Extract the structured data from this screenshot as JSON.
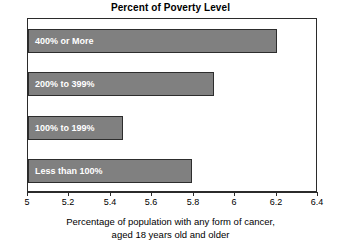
{
  "chart_data": {
    "type": "bar",
    "orientation": "horizontal",
    "title": "Percent of Poverty Level",
    "xlabel_line1": "Percentage of population with any form of cancer,",
    "xlabel_line2": "aged 18 years old and older",
    "ylabel": "",
    "categories": [
      "400% or More",
      "200% to 399%",
      "100% to 199%",
      "Less than 100%"
    ],
    "values": [
      6.2,
      5.9,
      5.46,
      5.79
    ],
    "xlim": [
      5,
      6.4
    ],
    "xticks": [
      5,
      5.2,
      5.4,
      5.6,
      5.8,
      6,
      6.4
    ],
    "xtick_labels": [
      "5",
      "5.2",
      "5.4",
      "5.6",
      "5.8",
      "6",
      "6.2",
      "6.4"
    ],
    "xtick_values": [
      5,
      5.2,
      5.4,
      5.6,
      5.8,
      6.0,
      6.2,
      6.4
    ],
    "grid": false,
    "legend": false,
    "bar_color": "#808080",
    "bar_border_color": "#2d2d2d",
    "plot_background": "#ffffff",
    "axis_color": "#2b2b2b",
    "label_text_color": "#ffffff"
  }
}
